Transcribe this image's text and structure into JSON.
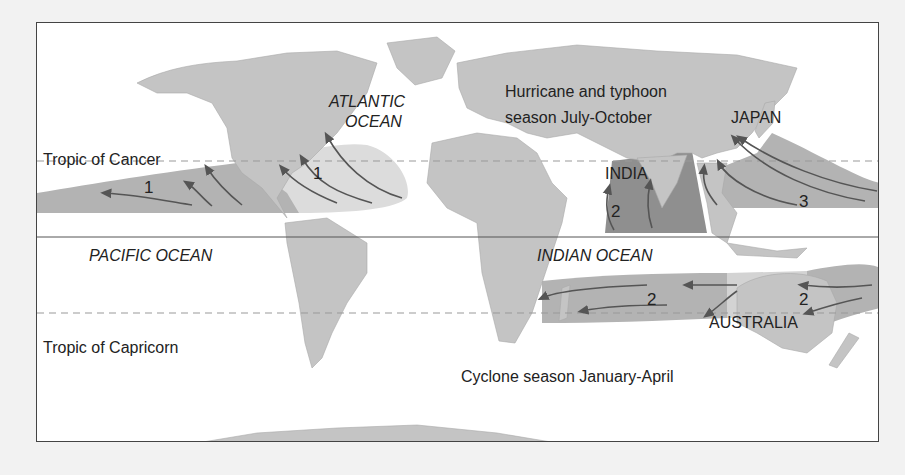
{
  "map": {
    "title": "Tropical cyclone regions and seasons",
    "colors": {
      "land": "#c4c4c4",
      "ocean": "#ffffff",
      "zone_light": "#dcdcdc",
      "zone_medium": "#b3b3b3",
      "zone_dark": "#8f8f8f",
      "arrow": "#555555",
      "tropic_line": "#999999",
      "equator_line": "#555555",
      "frame": "#444444"
    },
    "lines": {
      "tropic_of_cancer": "Tropic of Cancer",
      "tropic_of_capricorn": "Tropic of Capricorn"
    },
    "oceans": {
      "atlantic": "ATLANTIC\nOCEAN",
      "atlantic_line1": "ATLANTIC",
      "atlantic_line2": "OCEAN",
      "pacific": "PACIFIC OCEAN",
      "indian": "INDIAN OCEAN"
    },
    "regions": {
      "japan": "JAPAN",
      "india": "INDIA",
      "australia": "AUSTRALIA"
    },
    "seasons": {
      "northern_line1": "Hurricane and typhoon",
      "northern_line2": "season July-October",
      "southern": "Cyclone season January-April"
    },
    "zones": [
      {
        "id": "east-pacific",
        "number": "1",
        "shade": "medium"
      },
      {
        "id": "atlantic",
        "number": "1",
        "shade": "light"
      },
      {
        "id": "north-indian",
        "number": "2",
        "shade": "dark"
      },
      {
        "id": "west-pacific",
        "number": "3",
        "shade": "medium"
      },
      {
        "id": "south-indian",
        "number": "2",
        "shade": "medium"
      },
      {
        "id": "south-pacific",
        "number": "2",
        "shade": "medium"
      }
    ]
  }
}
